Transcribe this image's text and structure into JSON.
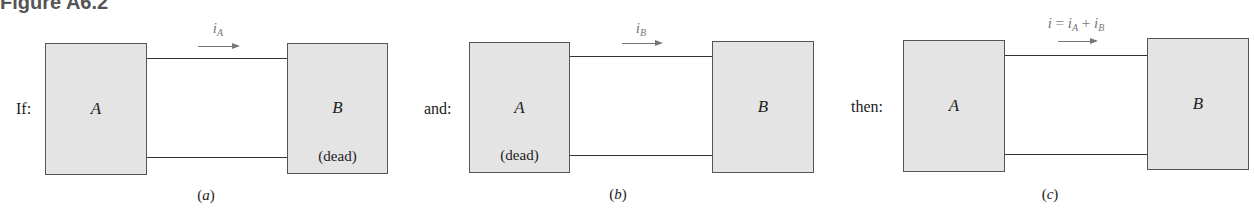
{
  "figure": {
    "title": "Figure A6.2"
  },
  "panels": [
    {
      "id": "a",
      "condition_label": "If:",
      "box_a": {
        "letter": "A",
        "note": ""
      },
      "box_b": {
        "letter": "B",
        "note": "(dead)"
      },
      "current": {
        "symbol": "i",
        "subscript": "A",
        "prefix": "",
        "sum_subscript": ""
      },
      "caption_letter": "a"
    },
    {
      "id": "b",
      "condition_label": "and:",
      "box_a": {
        "letter": "A",
        "note": "(dead)"
      },
      "box_b": {
        "letter": "B",
        "note": ""
      },
      "current": {
        "symbol": "i",
        "subscript": "B"
      },
      "caption_letter": "b"
    },
    {
      "id": "c",
      "condition_label": "then:",
      "box_a": {
        "letter": "A",
        "note": ""
      },
      "box_b": {
        "letter": "B",
        "note": ""
      },
      "current": {
        "lhs": "i",
        "equals": " = ",
        "term1_symbol": "i",
        "term1_subscript": "A",
        "plus": " + ",
        "term2_symbol": "i",
        "term2_subscript": "B"
      },
      "caption_letter": "c"
    }
  ],
  "colors": {
    "box_fill": "#e4e4e4",
    "box_border": "#555555",
    "wire": "#333333",
    "current_annotation": "#777777",
    "title": "#555555"
  }
}
